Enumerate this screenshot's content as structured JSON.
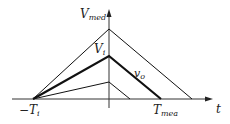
{
  "diagram": {
    "y_axis_label": {
      "main": "V",
      "sub": "med"
    },
    "x_axis_label": "t",
    "peak_label": {
      "main": "V",
      "sub": "i"
    },
    "output_label": {
      "main": "v",
      "sub": "o"
    },
    "start_label": {
      "main": "−T",
      "sub": "i"
    },
    "end_label": {
      "main": "T",
      "sub": "mea"
    },
    "colors": {
      "line": "#111111",
      "axis": "#333333",
      "background": "#ffffff"
    }
  }
}
